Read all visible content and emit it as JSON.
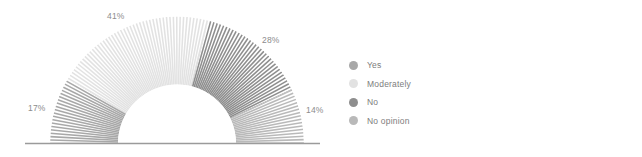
{
  "chart_data": {
    "type": "pie",
    "variant": "half-donut-gauge",
    "title": "",
    "subtitle": "",
    "xlabel": "",
    "ylabel": "",
    "grid": false,
    "legend_position": "right",
    "texture": "radial-stripes",
    "start_angle_deg": 180,
    "sweep_deg": 180,
    "direction": "clockwise",
    "categories": [
      "Yes",
      "Moderately",
      "No",
      "No opinion"
    ],
    "values": [
      17,
      41,
      28,
      14
    ],
    "unit": "%",
    "slices": [
      {
        "label": "Yes",
        "value": 17,
        "display": "17%",
        "color": "#a8a8a8"
      },
      {
        "label": "Moderately",
        "value": 41,
        "display": "41%",
        "color": "#e2e2e2"
      },
      {
        "label": "No",
        "value": 28,
        "display": "28%",
        "color": "#8e8e8e"
      },
      {
        "label": "No opinion",
        "value": 14,
        "display": "14%",
        "color": "#b9b9b9"
      }
    ],
    "data_labels": [
      "17%",
      "41%",
      "28%",
      "14%"
    ],
    "baseline_color": "#9b9b9b"
  },
  "legend": {
    "items": [
      {
        "label": "Yes",
        "color": "#a8a8a8",
        "swatch": "legend-dot-icon"
      },
      {
        "label": "Moderately",
        "color": "#e2e2e2",
        "swatch": "legend-dot-icon"
      },
      {
        "label": "No",
        "color": "#8e8e8e",
        "swatch": "legend-dot-icon"
      },
      {
        "label": "No opinion",
        "color": "#b9b9b9",
        "swatch": "legend-dot-icon"
      }
    ]
  },
  "labels": {
    "pct_yes": "17%",
    "pct_moderately": "41%",
    "pct_no": "28%",
    "pct_no_opinion": "14%"
  }
}
